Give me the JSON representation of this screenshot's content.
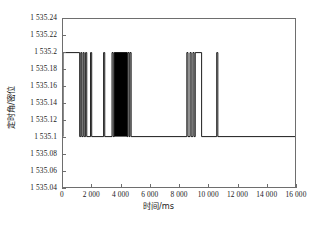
{
  "chart_data": {
    "type": "line",
    "title": "",
    "xlabel": "时间/ms",
    "ylabel": "定时角/密位",
    "xlim": [
      0,
      16000
    ],
    "ylim": [
      1535.04,
      1535.24
    ],
    "grid": false,
    "legend": null,
    "x_ticks": [
      0,
      2000,
      4000,
      6000,
      8000,
      10000,
      12000,
      14000,
      16000
    ],
    "x_tick_labels": [
      "0",
      "2 000",
      "4 000",
      "6 000",
      "8 000",
      "10 000",
      "12 000",
      "14 000",
      "16 000"
    ],
    "y_ticks": [
      1535.04,
      1535.06,
      1535.08,
      1535.1,
      1535.12,
      1535.14,
      1535.16,
      1535.18,
      1535.2,
      1535.22,
      1535.24
    ],
    "y_tick_labels": [
      "1 535.04",
      "1 535.06",
      "1 535.08",
      "1 535.1",
      "1 535.12",
      "1 535.14",
      "1 535.16",
      "1 535.18",
      "1 535.2",
      "1 535.22",
      "1 535.24"
    ],
    "line_color": "#000000",
    "baseline_low": 1535.1,
    "level_high": 1535.2,
    "high_intervals_ms": [
      [
        0,
        1150
      ],
      [
        1230,
        1300
      ],
      [
        1390,
        1460
      ],
      [
        1560,
        1640
      ],
      [
        1900,
        1980
      ],
      [
        2800,
        2880
      ],
      [
        3380,
        3460
      ],
      [
        3530,
        4430
      ],
      [
        4480,
        4560
      ],
      [
        4620,
        4700
      ],
      [
        8540,
        8620
      ],
      [
        8760,
        8840
      ],
      [
        8960,
        9040
      ],
      [
        9120,
        9560
      ],
      [
        10600,
        10680
      ]
    ],
    "dense_band_ms": [
      3530,
      4430
    ],
    "segments_note": "Values outside the listed high intervals sit at the 1535.1 baseline across the full 0-16 000 ms span."
  },
  "caption": {
    "text": ""
  }
}
